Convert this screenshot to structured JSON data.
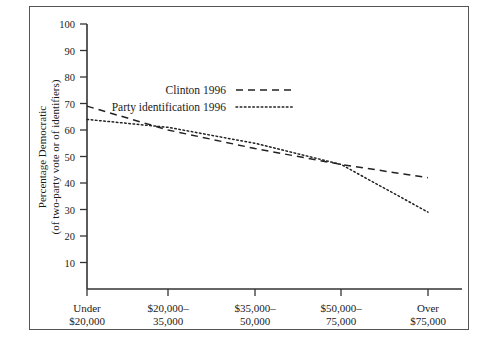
{
  "figure": {
    "border_color": "#555555",
    "background": "#ffffff"
  },
  "chart_data": {
    "type": "line",
    "title": "",
    "xlabel": "",
    "ylabel": "Percentage Democratic",
    "ylabel_line2": "(of two-party vote or of identifiers)",
    "categories": [
      "Under\n$20,000",
      "$20,000–\n35,000",
      "$35,000–\n50,000",
      "$50,000–\n75,000",
      "Over\n$75,000"
    ],
    "category_labels": [
      {
        "line1": "Under",
        "line2": "$20,000"
      },
      {
        "line1": "$20,000–",
        "line2": "35,000"
      },
      {
        "line1": "$35,000–",
        "line2": "50,000"
      },
      {
        "line1": "$50,000–",
        "line2": "75,000"
      },
      {
        "line1": "Over",
        "line2": "$75,000"
      }
    ],
    "ylim": [
      0,
      100
    ],
    "yticks": [
      10,
      20,
      30,
      40,
      50,
      60,
      70,
      80,
      90,
      100
    ],
    "grid": false,
    "legend_position": "upper-center",
    "series": [
      {
        "name": "Clinton 1996",
        "style": "dashed",
        "color": "#222222",
        "values": [
          69,
          60,
          53,
          47,
          42
        ]
      },
      {
        "name": "Party identification 1996",
        "style": "dotted",
        "color": "#222222",
        "values": [
          64,
          61,
          55,
          47,
          29
        ]
      }
    ]
  },
  "legend": {
    "items": [
      {
        "label": "Clinton 1996",
        "style": "dashed"
      },
      {
        "label": "Party identification 1996",
        "style": "dotted"
      }
    ]
  },
  "caption": {
    "text": ""
  }
}
